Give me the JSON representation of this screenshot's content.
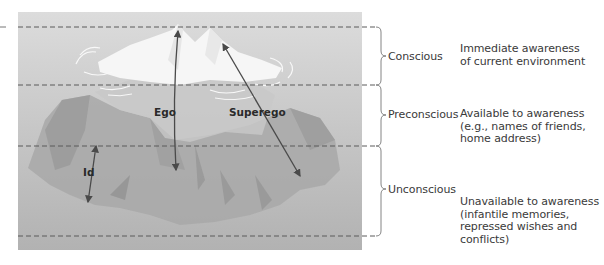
{
  "figure": {
    "structures": [
      {
        "id": "ego",
        "label": "Ego"
      },
      {
        "id": "superego",
        "label": "Superego"
      },
      {
        "id": "id",
        "label": "Id"
      }
    ],
    "levels": [
      {
        "id": "conscious",
        "label": "Conscious",
        "description": [
          "Immediate awareness",
          "of current environment"
        ]
      },
      {
        "id": "preconscious",
        "label": "Preconscious",
        "description": [
          "Available to awareness",
          "(e.g., names of friends,",
          "home address)"
        ]
      },
      {
        "id": "unconscious",
        "label": "Unconscious",
        "description": [
          "Unavailable to awareness",
          "(infantile memories,",
          "repressed wishes and",
          "conflicts)"
        ]
      }
    ],
    "colors": {
      "water_top": "#d9d9d9",
      "water_bottom": "#b3b3b3",
      "ice_above": "#f7f7f7",
      "ice_below": "#a9a9a9",
      "dash_line": "#5a5a5a",
      "arrow": "#4a4a4a"
    }
  }
}
